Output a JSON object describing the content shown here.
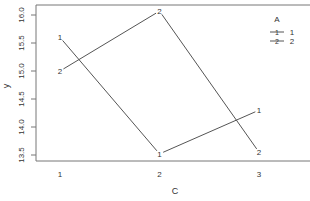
{
  "chart_data": {
    "type": "line",
    "title": "",
    "xlabel": "C",
    "ylabel": "y",
    "x": [
      1,
      2,
      3
    ],
    "x_tick_labels": [
      "1",
      "2",
      "3"
    ],
    "y_ticks": [
      13.5,
      14.0,
      14.5,
      15.0,
      15.5,
      16.0
    ],
    "y_tick_labels": [
      "13.5",
      "14.0",
      "14.5",
      "15.0",
      "15.5",
      "16.0"
    ],
    "ylim": [
      13.4,
      16.15
    ],
    "grid": false,
    "legend": {
      "title": "A",
      "position": "top-right",
      "entries": [
        "1",
        "2"
      ]
    },
    "series": [
      {
        "name": "1",
        "marker": "1",
        "values": [
          15.6,
          13.52,
          14.3
        ]
      },
      {
        "name": "2",
        "marker": "2",
        "values": [
          15.0,
          16.07,
          13.55
        ]
      }
    ],
    "colors": {
      "line": "#555555",
      "axis": "#555555",
      "text": "#333333"
    }
  }
}
